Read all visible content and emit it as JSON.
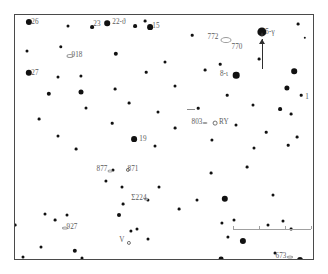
{
  "chart": {
    "frame_color": "#4a4a4a",
    "background_color": "#ffffff",
    "star_color": "#111111",
    "label_color": "#5c5c5c"
  },
  "scale_bar": {
    "name": "scale-bar",
    "x": 232,
    "y": 228,
    "length": 78,
    "ticks": [
      0,
      26,
      52,
      78
    ]
  },
  "gamma_arrow": {
    "name": "pointer-arrow-to-gamma",
    "x": 261,
    "top": 38,
    "bottom": 68
  },
  "chart_data": {
    "type": "scatter",
    "xlabel": "",
    "ylabel": "",
    "xlim": [
      0,
      300
    ],
    "ylim": [
      0,
      246
    ],
    "grid": false,
    "legend": "none",
    "marker_types": {
      "star": "filled disc, size by magnitude",
      "open-star": "hollow circle (variable star)",
      "dso": "small ellipse (deep-sky object)"
    },
    "labels": [
      {
        "text": "26",
        "x": 20,
        "y": 8,
        "anchor": "left"
      },
      {
        "text": "23",
        "x": 82,
        "y": 10,
        "anchor": "right"
      },
      {
        "text": "22-ϑ",
        "x": 104,
        "y": 8,
        "anchor": "left"
      },
      {
        "text": "15",
        "x": 141,
        "y": 12,
        "anchor": "left"
      },
      {
        "text": "772",
        "x": 198,
        "y": 23,
        "anchor": "right"
      },
      {
        "text": "770",
        "x": 222,
        "y": 33,
        "anchor": "left"
      },
      {
        "text": "5-γ",
        "x": 255,
        "y": 18,
        "anchor": "left"
      },
      {
        "text": "918",
        "x": 62,
        "y": 41,
        "anchor": "left"
      },
      {
        "text": "27",
        "x": 20,
        "y": 59,
        "anchor": "left"
      },
      {
        "text": "8-ι",
        "x": 209,
        "y": 60,
        "anchor": "right"
      },
      {
        "text": "1",
        "x": 292,
        "y": 83,
        "anchor": "left"
      },
      {
        "text": "803",
        "x": 182,
        "y": 108,
        "anchor": "right"
      },
      {
        "text": "RY",
        "x": 209,
        "y": 108,
        "anchor": "left"
      },
      {
        "text": "19",
        "x": 128,
        "y": 125,
        "anchor": "left"
      },
      {
        "text": "877",
        "x": 87,
        "y": 155,
        "anchor": "right"
      },
      {
        "text": "871",
        "x": 118,
        "y": 155,
        "anchor": "left"
      },
      {
        "text": "Σ224",
        "x": 124,
        "y": 184,
        "anchor": "right"
      },
      {
        "text": "927",
        "x": 57,
        "y": 213,
        "anchor": "left"
      },
      {
        "text": "V",
        "x": 107,
        "y": 226,
        "anchor": "right"
      },
      {
        "text": "673",
        "x": 266,
        "y": 242,
        "anchor": "right"
      },
      {
        "text": "821",
        "x": 150,
        "y": 251,
        "anchor": "right"
      },
      {
        "text": "Σ178",
        "x": 240,
        "y": 252,
        "anchor": "right"
      },
      {
        "text": "24-ξ",
        "x": 63,
        "y": 259,
        "anchor": "left"
      }
    ],
    "stars": [
      {
        "x": 14,
        "y": 7,
        "r": 3.1
      },
      {
        "x": 53,
        "y": 11,
        "r": 1.5
      },
      {
        "x": 77,
        "y": 12,
        "r": 1.9
      },
      {
        "x": 92,
        "y": 8,
        "r": 2.8
      },
      {
        "x": 120,
        "y": 11,
        "r": 1.9
      },
      {
        "x": 130,
        "y": 6,
        "r": 1.4
      },
      {
        "x": 135,
        "y": 12,
        "r": 2.9
      },
      {
        "x": 177,
        "y": 20,
        "r": 1.3
      },
      {
        "x": 247,
        "y": 17,
        "r": 4.6
      },
      {
        "x": 283,
        "y": 9,
        "r": 1.4
      },
      {
        "x": 290,
        "y": 23,
        "r": 1.2
      },
      {
        "x": 12,
        "y": 36,
        "r": 1.5
      },
      {
        "x": 46,
        "y": 32,
        "r": 1.7
      },
      {
        "x": 101,
        "y": 39,
        "r": 2.2
      },
      {
        "x": 150,
        "y": 47,
        "r": 1.5
      },
      {
        "x": 205,
        "y": 49,
        "r": 1.3
      },
      {
        "x": 244,
        "y": 44,
        "r": 1.4
      },
      {
        "x": 14,
        "y": 58,
        "r": 3.2
      },
      {
        "x": 43,
        "y": 62,
        "r": 1.5
      },
      {
        "x": 66,
        "y": 61,
        "r": 1.6
      },
      {
        "x": 131,
        "y": 57,
        "r": 1.3
      },
      {
        "x": 190,
        "y": 55,
        "r": 1.4
      },
      {
        "x": 221,
        "y": 60,
        "r": 3.3
      },
      {
        "x": 279,
        "y": 56,
        "r": 2.8
      },
      {
        "x": 34,
        "y": 79,
        "r": 2.2
      },
      {
        "x": 66,
        "y": 77,
        "r": 2.5
      },
      {
        "x": 100,
        "y": 74,
        "r": 1.4
      },
      {
        "x": 160,
        "y": 71,
        "r": 1.5
      },
      {
        "x": 212,
        "y": 80,
        "r": 1.3
      },
      {
        "x": 272,
        "y": 73,
        "r": 2.6
      },
      {
        "x": 286,
        "y": 80,
        "r": 1.3
      },
      {
        "x": 71,
        "y": 93,
        "r": 1.5
      },
      {
        "x": 114,
        "y": 88,
        "r": 1.4
      },
      {
        "x": 143,
        "y": 97,
        "r": 1.5
      },
      {
        "x": 183,
        "y": 93,
        "r": 1.3
      },
      {
        "x": 238,
        "y": 90,
        "r": 1.5
      },
      {
        "x": 265,
        "y": 94,
        "r": 1.9
      },
      {
        "x": 276,
        "y": 99,
        "r": 1.4
      },
      {
        "x": 24,
        "y": 104,
        "r": 1.4
      },
      {
        "x": 97,
        "y": 108,
        "r": 1.3
      },
      {
        "x": 160,
        "y": 113,
        "r": 1.4
      },
      {
        "x": 221,
        "y": 110,
        "r": 1.5
      },
      {
        "x": 251,
        "y": 117,
        "r": 1.3
      },
      {
        "x": 43,
        "y": 121,
        "r": 1.5
      },
      {
        "x": 119,
        "y": 124,
        "r": 2.9
      },
      {
        "x": 197,
        "y": 125,
        "r": 1.6
      },
      {
        "x": 282,
        "y": 122,
        "r": 1.4
      },
      {
        "x": 61,
        "y": 134,
        "r": 1.4
      },
      {
        "x": 140,
        "y": 131,
        "r": 1.5
      },
      {
        "x": 239,
        "y": 133,
        "r": 1.5
      },
      {
        "x": 273,
        "y": 130,
        "r": 1.3
      },
      {
        "x": 98,
        "y": 155,
        "r": 1.5
      },
      {
        "x": 196,
        "y": 158,
        "r": 1.4
      },
      {
        "x": 91,
        "y": 166,
        "r": 1.6
      },
      {
        "x": 107,
        "y": 172,
        "r": 1.5
      },
      {
        "x": 232,
        "y": 152,
        "r": 1.4
      },
      {
        "x": 144,
        "y": 172,
        "r": 1.5
      },
      {
        "x": 133,
        "y": 185,
        "r": 1.6
      },
      {
        "x": 182,
        "y": 185,
        "r": 1.5
      },
      {
        "x": 210,
        "y": 184,
        "r": 3.2
      },
      {
        "x": 258,
        "y": 180,
        "r": 1.5
      },
      {
        "x": 108,
        "y": 189,
        "r": 1.4
      },
      {
        "x": 164,
        "y": 194,
        "r": 1.4
      },
      {
        "x": 30,
        "y": 199,
        "r": 1.5
      },
      {
        "x": 40,
        "y": 205,
        "r": 1.4
      },
      {
        "x": 52,
        "y": 200,
        "r": 1.5
      },
      {
        "x": 104,
        "y": 200,
        "r": 2.0
      },
      {
        "x": 207,
        "y": 208,
        "r": 1.6
      },
      {
        "x": 219,
        "y": 205,
        "r": 1.5
      },
      {
        "x": 253,
        "y": 210,
        "r": 1.5
      },
      {
        "x": 268,
        "y": 206,
        "r": 1.5
      },
      {
        "x": 276,
        "y": 214,
        "r": 1.4
      },
      {
        "x": 0,
        "y": 210,
        "r": 1.4
      },
      {
        "x": 116,
        "y": 216,
        "r": 1.6
      },
      {
        "x": 122,
        "y": 214,
        "r": 1.5
      },
      {
        "x": 133,
        "y": 224,
        "r": 1.5
      },
      {
        "x": 213,
        "y": 222,
        "r": 1.6
      },
      {
        "x": 228,
        "y": 226,
        "r": 3.1
      },
      {
        "x": 26,
        "y": 232,
        "r": 1.5
      },
      {
        "x": 60,
        "y": 236,
        "r": 2.2
      },
      {
        "x": 67,
        "y": 243,
        "r": 1.5
      },
      {
        "x": 52,
        "y": 250,
        "r": 1.4
      },
      {
        "x": 8,
        "y": 242,
        "r": 1.5
      },
      {
        "x": 260,
        "y": 238,
        "r": 1.5
      },
      {
        "x": 206,
        "y": 244,
        "r": 2.4
      },
      {
        "x": 285,
        "y": 245,
        "r": 3.0
      },
      {
        "x": 272,
        "y": 254,
        "r": 1.5
      },
      {
        "x": 304,
        "y": 252,
        "r": 1.5
      },
      {
        "x": 44,
        "y": 260,
        "r": 2.0
      },
      {
        "x": 53,
        "y": 261,
        "r": 3.0
      },
      {
        "x": 122,
        "y": 258,
        "r": 1.4
      },
      {
        "x": 217,
        "y": 260,
        "r": 1.4
      },
      {
        "x": 50,
        "y": 247,
        "r": 1.5
      }
    ],
    "open_stars": [
      {
        "x": 200,
        "y": 108,
        "r": 2.4,
        "label": "RY"
      },
      {
        "x": 113,
        "y": 155,
        "r": 2.1,
        "label": "871"
      },
      {
        "x": 114,
        "y": 228,
        "r": 2.1,
        "label": "V"
      }
    ],
    "deep_sky_objects": [
      {
        "x": 55,
        "y": 41,
        "w": 7,
        "h": 4,
        "label": "918"
      },
      {
        "x": 211,
        "y": 25,
        "w": 11,
        "h": 6,
        "label": "772/770"
      },
      {
        "x": 50,
        "y": 213,
        "w": 6,
        "h": 3,
        "label": "927"
      },
      {
        "x": 158,
        "y": 249,
        "w": 6,
        "h": 3,
        "label": "821"
      },
      {
        "x": 275,
        "y": 242,
        "w": 6,
        "h": 3,
        "label": "673"
      },
      {
        "x": 95,
        "y": 156,
        "w": 5,
        "h": 3,
        "label": "877"
      },
      {
        "x": 190,
        "y": 108,
        "w": 5,
        "h": 2,
        "label": "803-pointer"
      },
      {
        "x": 131,
        "y": 184,
        "w": 4,
        "h": 3,
        "label": "Σ224"
      }
    ]
  }
}
